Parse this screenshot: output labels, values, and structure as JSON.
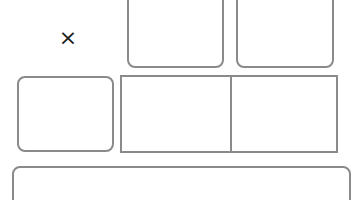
{
  "close_button": {
    "glyph": "×",
    "icon": "close-icon"
  },
  "panels": [
    {
      "id": "top-middle-panel"
    },
    {
      "id": "top-right-panel"
    },
    {
      "id": "middle-left-panel"
    },
    {
      "id": "middle-center-panel"
    },
    {
      "id": "middle-right-panel"
    },
    {
      "id": "bottom-wide-panel"
    }
  ],
  "colors": {
    "border": "#8a8a8a",
    "icon": "#222222",
    "background": "#ffffff"
  }
}
